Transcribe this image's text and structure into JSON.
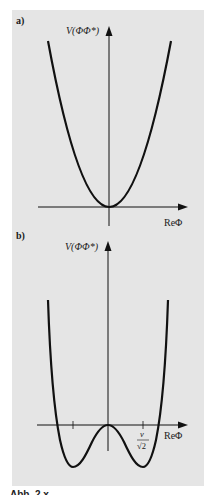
{
  "figure": {
    "background": "#e5e5e5",
    "line_color": "#111111",
    "panels": [
      {
        "id": "a",
        "label": "a)",
        "y_axis_label": "V(ΦΦ*)",
        "x_axis_label": "ReΦ",
        "curve": "parabola with minimum at origin"
      },
      {
        "id": "b",
        "label": "b)",
        "y_axis_label": "V(ΦΦ*)",
        "x_axis_label": "ReΦ",
        "tick_label_numerator": "v",
        "tick_label_denominator": "√2",
        "curve": "double-well (Mexican hat) potential with minima at ±v/√2"
      }
    ],
    "caption_fragment": "Abb. 2.x"
  }
}
